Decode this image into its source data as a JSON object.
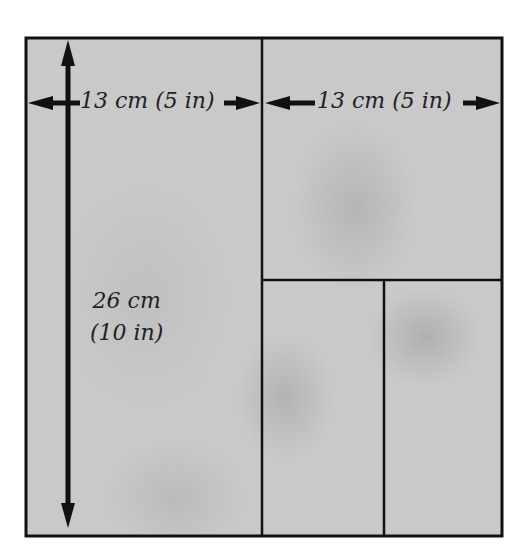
{
  "diagram": {
    "colors": {
      "background": "#ffffff",
      "board_fill": "#c9c9c9",
      "lines": "#111111",
      "text": "#222222"
    },
    "pieces": [
      {
        "name": "left-full-height-panel",
        "position": "left half, full height"
      },
      {
        "name": "top-right-panel",
        "position": "right half, upper"
      },
      {
        "name": "bottom-right-left-panel",
        "position": "right half, lower-left"
      },
      {
        "name": "bottom-right-right-panel",
        "position": "right half, lower-right"
      }
    ],
    "dimensions": {
      "left_width": "13 cm (5 in)",
      "right_width": "13 cm (5 in)",
      "height_line1": "26 cm",
      "height_line2": "(10 in)"
    }
  }
}
